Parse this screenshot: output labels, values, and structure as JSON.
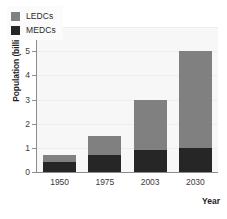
{
  "panel": {
    "label": "(a)"
  },
  "chart_data": {
    "type": "bar",
    "subtype": "stacked-vertical",
    "title": "",
    "xlabel": "Year",
    "ylabel": "Population (billions)",
    "categories": [
      "1950",
      "1975",
      "2003",
      "2030"
    ],
    "series": [
      {
        "name": "MEDCs",
        "color": "#262626",
        "values": [
          0.4,
          0.7,
          0.9,
          1.0
        ]
      },
      {
        "name": "LEDCs",
        "color": "#808080",
        "values": [
          0.3,
          0.8,
          2.1,
          4.0
        ]
      }
    ],
    "totals": [
      0.7,
      1.5,
      3.0,
      5.0
    ],
    "ylim": [
      0,
      6
    ],
    "yticks": [
      "0",
      "1",
      "2",
      "3",
      "4",
      "5",
      "6"
    ],
    "grid": true,
    "legend": {
      "position": "top-left",
      "entries": [
        {
          "label": "LEDCs",
          "color": "#808080"
        },
        {
          "label": "MEDCs",
          "color": "#262626"
        }
      ]
    },
    "plot_background": "#f7f7f7",
    "axis_color": "#8d8d8d"
  }
}
